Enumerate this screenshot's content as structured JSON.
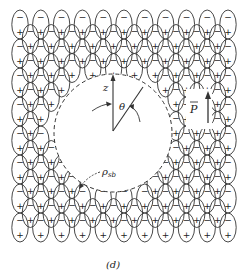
{
  "figure": {
    "caption": "(d)",
    "labels": {
      "z_axis": "z",
      "angle": "θ",
      "polarization": "P",
      "surface_charge": "ρ",
      "surface_charge_sub": "sb"
    },
    "dipole_signs": {
      "top": "−",
      "bottom": "+"
    },
    "cavity": {
      "cx": 113,
      "cy": 133,
      "r": 59
    },
    "grid": {
      "x_start": 20,
      "col_pitch": 10.4,
      "cols": 21,
      "y_start": 10,
      "row_pitch": 29,
      "ell_rx": 8.2,
      "ell_ry": 14.5,
      "y_end": 248
    },
    "colors": {
      "stroke": "#333333",
      "background": "#ffffff"
    }
  }
}
